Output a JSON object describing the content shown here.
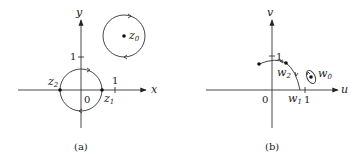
{
  "panel_a": {
    "caption": "(a)",
    "x_axis_label": "x",
    "y_axis_label": "y",
    "origin_label": "0",
    "tick_x": "1",
    "tick_y": "1",
    "points": {
      "z0": {
        "base": "z",
        "sub": "0"
      },
      "z1": {
        "base": "z",
        "sub": "1"
      },
      "z2": {
        "base": "z",
        "sub": "2"
      }
    }
  },
  "panel_b": {
    "caption": "(b)",
    "u_axis_label": "u",
    "v_axis_label": "v",
    "origin_label": "0",
    "tick_u": "1",
    "tick_v": "1",
    "points": {
      "w0": {
        "base": "w",
        "sub": "0"
      },
      "w1": {
        "base": "w",
        "sub": "1"
      },
      "w2": {
        "base": "w",
        "sub": "2"
      }
    }
  }
}
